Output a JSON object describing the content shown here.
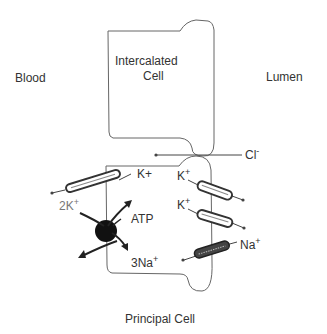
{
  "labels": {
    "blood": "Blood",
    "lumen": "Lumen",
    "intercalated_line1": "Intercalated",
    "intercalated_line2": "Cell",
    "principal": "Principal Cell",
    "atp": "ATP"
  },
  "ions": {
    "cl": {
      "base": "Cl",
      "sup": "-"
    },
    "k_basolateral": {
      "base": "K",
      "sup": "+"
    },
    "k_pump": {
      "base": "2K",
      "sup": "+"
    },
    "na_pump": {
      "base": "3Na",
      "sup": "+"
    },
    "k_apical_1": {
      "base": "K",
      "sup": "+"
    },
    "k_apical_2": {
      "base": "K",
      "sup": "+"
    },
    "na_apical": {
      "base": "Na",
      "sup": "+"
    }
  },
  "colors": {
    "stroke": "#555555",
    "pump": "#111111",
    "text": "#333333"
  }
}
